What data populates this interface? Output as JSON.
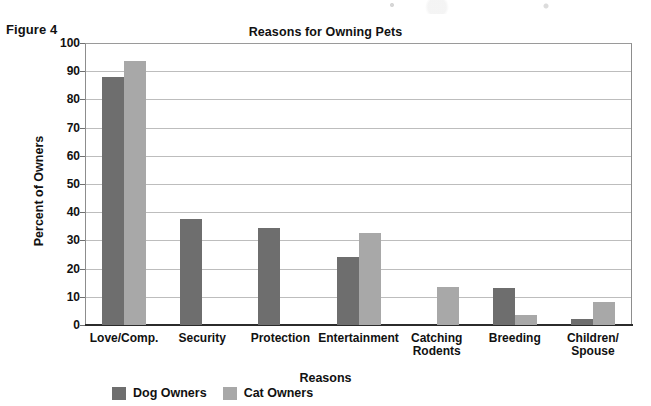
{
  "figure_label": "Figure 4",
  "axis": {
    "y_title": "Percent of Owners",
    "x_title": "Reasons",
    "y_ticks": [
      "100",
      "90",
      "80",
      "70",
      "60",
      "50",
      "40",
      "30",
      "20",
      "10",
      "0"
    ]
  },
  "legend": {
    "items": [
      {
        "label": "Dog Owners",
        "color": "#6e6e6e"
      },
      {
        "label": "Cat Owners",
        "color": "#a8a8a8"
      }
    ]
  },
  "chart_data": {
    "type": "bar",
    "title": "Reasons for Owning Pets",
    "xlabel": "Reasons",
    "ylabel": "Percent of Owners",
    "ylim": [
      0,
      100
    ],
    "ytick_step": 10,
    "grid": true,
    "legend_position": "bottom-left",
    "categories": [
      "Love/Comp.",
      "Security",
      "Protection",
      "Entertainment",
      "Catching\nRodents",
      "Breeding",
      "Children/\nSpouse"
    ],
    "series": [
      {
        "name": "Dog Owners",
        "color": "#6e6e6e",
        "values": [
          88,
          37.5,
          34.5,
          24,
          0,
          13,
          2
        ]
      },
      {
        "name": "Cat Owners",
        "color": "#a8a8a8",
        "values": [
          93.5,
          0,
          0,
          32.5,
          13.5,
          3.5,
          8
        ]
      }
    ]
  }
}
